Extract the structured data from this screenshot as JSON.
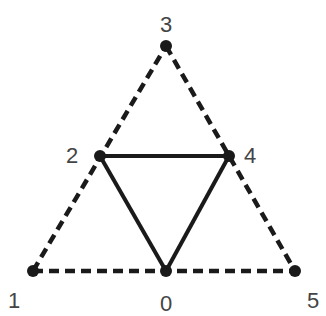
{
  "diagram": {
    "nodes": [
      {
        "id": "0",
        "label": "0",
        "x": 166,
        "y": 271,
        "lx": 166,
        "ly": 305
      },
      {
        "id": "1",
        "label": "1",
        "x": 33,
        "y": 271,
        "lx": 14,
        "ly": 302
      },
      {
        "id": "2",
        "label": "2",
        "x": 100,
        "y": 156,
        "lx": 72,
        "ly": 157
      },
      {
        "id": "3",
        "label": "3",
        "x": 166,
        "y": 46,
        "lx": 166,
        "ly": 26
      },
      {
        "id": "4",
        "label": "4",
        "x": 229,
        "y": 156,
        "lx": 250,
        "ly": 157
      },
      {
        "id": "5",
        "label": "5",
        "x": 295,
        "y": 271,
        "lx": 313,
        "ly": 302
      }
    ],
    "edges": [
      {
        "from": "1",
        "to": "3",
        "style": "dashed"
      },
      {
        "from": "3",
        "to": "5",
        "style": "dashed"
      },
      {
        "from": "1",
        "to": "5",
        "style": "dashed"
      },
      {
        "from": "2",
        "to": "4",
        "style": "solid"
      },
      {
        "from": "2",
        "to": "0",
        "style": "solid"
      },
      {
        "from": "4",
        "to": "0",
        "style": "solid"
      }
    ],
    "colors": {
      "line": "#1a1a1a",
      "node": "#1a1a1a",
      "label": "#444444"
    }
  }
}
